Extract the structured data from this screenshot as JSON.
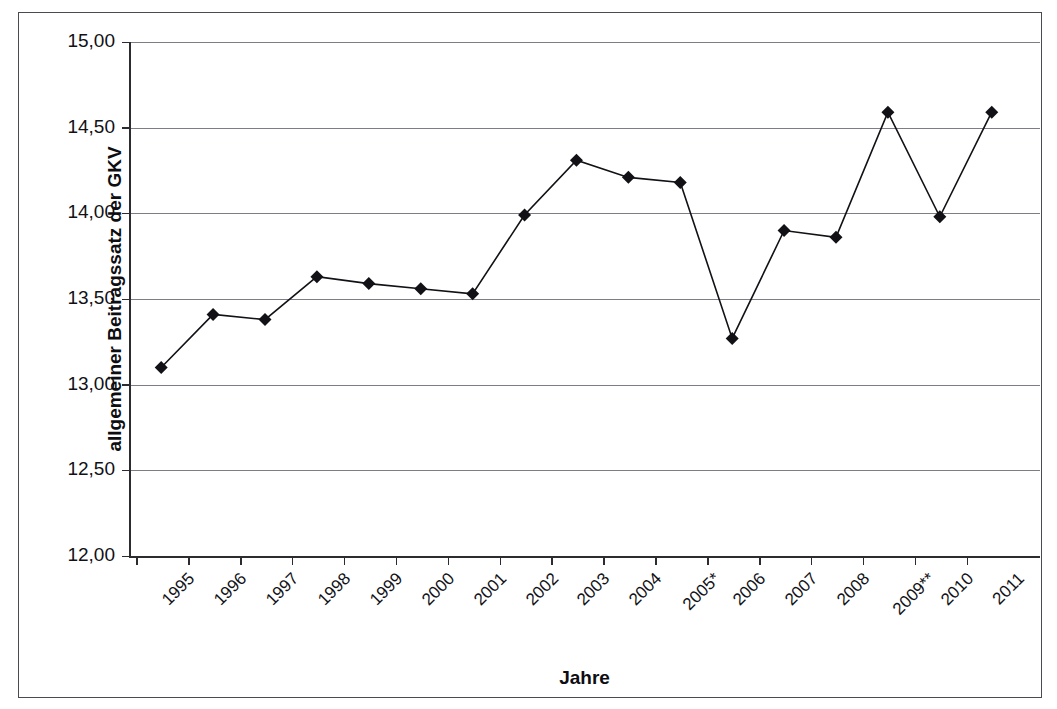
{
  "chart_data": {
    "type": "line",
    "title": "",
    "xlabel": "Jahre",
    "ylabel": "allgemeiner Beitragssatz der GKV",
    "categories": [
      "1995",
      "1996",
      "1997",
      "1998",
      "1999",
      "2000",
      "2001",
      "2002",
      "2003",
      "2004",
      "2005*",
      "2006",
      "2007",
      "2008",
      "2009**",
      "2010",
      "2011"
    ],
    "values": [
      13.1,
      13.41,
      13.38,
      13.63,
      13.59,
      13.56,
      13.53,
      13.99,
      14.31,
      14.21,
      14.18,
      13.27,
      13.9,
      13.86,
      14.59,
      13.98,
      14.59
    ],
    "ylim": [
      12.0,
      15.0
    ],
    "ytick_labels": [
      "15,00",
      "14,50",
      "14,00",
      "13,50",
      "13,00",
      "12,50",
      "12,00"
    ],
    "ytick_values": [
      15.0,
      14.5,
      14.0,
      13.5,
      13.0,
      12.5,
      12.0
    ],
    "grid": true,
    "legend": "none",
    "marker": "diamond",
    "series_color": "#111116",
    "grid_color": "#7d7d85",
    "axis_color": "#2b2b30",
    "background": "#ffffff"
  },
  "frame": {
    "border_color": "#4a4a52"
  }
}
